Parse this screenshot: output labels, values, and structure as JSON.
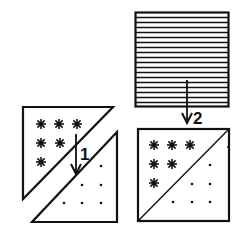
{
  "diagram": {
    "steps": [
      {
        "number": "1",
        "description": "Join star-fabric triangle to dot-fabric triangle along diagonal"
      },
      {
        "number": "2",
        "description": "Place striped square on top of pieced half-square triangle unit"
      }
    ],
    "labels": {
      "step1": "1",
      "step2": "2"
    },
    "pieces": {
      "star_triangle": {
        "pattern": "asterisks",
        "motif_count": 6,
        "rows": [
          3,
          2,
          1
        ]
      },
      "dot_triangle": {
        "pattern": "dots",
        "motif_count": 6,
        "rows": [
          1,
          2,
          3
        ]
      },
      "striped_square": {
        "pattern": "horizontal-stripes",
        "stripe_count": 18
      },
      "pieced_square": {
        "top_left": "asterisks",
        "bottom_right": "dots"
      }
    },
    "colors": {
      "ink": "#111111",
      "paper": "#ffffff"
    }
  }
}
